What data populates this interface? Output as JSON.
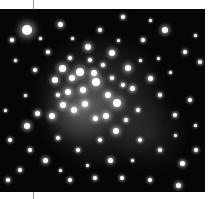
{
  "image": {
    "subject": "star cluster astrophotograph",
    "alt": "Dense open star cluster on black sky, grayscale",
    "colors": {
      "sky": "#060606",
      "star": "#ffffff",
      "border": "#ffffff",
      "tick": "#9a9a9a"
    },
    "glows": [
      {
        "x": 100,
        "y": 92,
        "r": 70,
        "alpha": 0.22
      },
      {
        "x": 80,
        "y": 100,
        "r": 38,
        "alpha": 0.25
      },
      {
        "x": 150,
        "y": 125,
        "r": 40,
        "alpha": 0.1
      }
    ],
    "stars": [
      [
        27,
        30,
        5
      ],
      [
        88,
        47,
        3
      ],
      [
        112,
        53,
        3
      ],
      [
        62,
        68,
        3.5
      ],
      [
        80,
        72,
        4
      ],
      [
        72,
        78,
        3
      ],
      [
        94,
        73,
        3
      ],
      [
        96,
        82,
        4
      ],
      [
        83,
        90,
        3
      ],
      [
        68,
        92,
        3
      ],
      [
        55,
        80,
        3
      ],
      [
        117,
        103,
        4
      ],
      [
        128,
        68,
        3
      ],
      [
        108,
        95,
        3
      ],
      [
        63,
        105,
        3
      ],
      [
        74,
        110,
        3
      ],
      [
        85,
        104,
        3
      ],
      [
        106,
        116,
        3
      ],
      [
        116,
        131,
        3
      ],
      [
        52,
        116,
        3
      ],
      [
        27,
        126,
        3
      ],
      [
        37,
        113,
        2.5
      ],
      [
        95,
        118,
        2.5
      ],
      [
        132,
        88,
        2.5
      ],
      [
        150,
        78,
        2.5
      ],
      [
        165,
        30,
        3
      ],
      [
        60,
        24,
        2.5
      ],
      [
        123,
        17,
        2
      ],
      [
        185,
        52,
        2
      ],
      [
        12,
        40,
        2
      ],
      [
        200,
        62,
        2
      ],
      [
        190,
        100,
        2
      ],
      [
        175,
        115,
        2
      ],
      [
        140,
        140,
        2
      ],
      [
        110,
        160,
        2.5
      ],
      [
        122,
        178,
        2
      ],
      [
        45,
        160,
        2.5
      ],
      [
        20,
        170,
        2
      ],
      [
        70,
        180,
        2
      ],
      [
        160,
        150,
        2
      ],
      [
        182,
        163,
        2.5
      ],
      [
        196,
        150,
        2
      ],
      [
        178,
        185,
        2.5
      ],
      [
        150,
        180,
        2
      ],
      [
        95,
        178,
        2
      ],
      [
        30,
        150,
        2
      ],
      [
        10,
        140,
        2
      ],
      [
        8,
        180,
        2
      ],
      [
        100,
        140,
        2
      ],
      [
        78,
        150,
        2
      ],
      [
        58,
        138,
        2
      ],
      [
        138,
        110,
        2
      ],
      [
        160,
        95,
        2
      ],
      [
        143,
        40,
        2
      ],
      [
        100,
        30,
        2
      ],
      [
        48,
        52,
        2
      ],
      [
        35,
        70,
        2
      ],
      [
        15,
        60,
        1.5
      ],
      [
        170,
        72,
        1.5
      ],
      [
        195,
        35,
        1.5
      ],
      [
        150,
        20,
        1.5
      ],
      [
        175,
        135,
        1.5
      ],
      [
        132,
        160,
        1.5
      ],
      [
        87,
        165,
        1.5
      ],
      [
        60,
        170,
        1.5
      ],
      [
        25,
        95,
        1.5
      ],
      [
        5,
        110,
        1.5
      ],
      [
        195,
        125,
        1.5
      ],
      [
        158,
        58,
        1.5
      ],
      [
        118,
        40,
        1.5
      ],
      [
        72,
        38,
        1.5
      ],
      [
        40,
        38,
        1.5
      ],
      [
        140,
        60,
        1.5
      ],
      [
        123,
        85,
        2
      ],
      [
        103,
        65,
        2
      ],
      [
        90,
        60,
        2
      ],
      [
        70,
        58,
        2
      ],
      [
        58,
        95,
        2
      ],
      [
        112,
        78,
        2
      ],
      [
        126,
        120,
        2
      ]
    ]
  }
}
